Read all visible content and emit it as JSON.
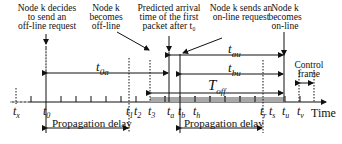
{
  "annotations": [
    {
      "id": "t0-note",
      "lines": [
        "Node k decides",
        "to send an",
        "off-line request"
      ]
    },
    {
      "id": "t2-note",
      "lines": [
        "Node k",
        "becomes",
        "off-line"
      ]
    },
    {
      "id": "ta-note",
      "lines": [
        "Predicted  arrival",
        "time of the first",
        "packet after t₀"
      ]
    },
    {
      "id": "tb-note",
      "lines": [
        "Node k sends an",
        "on-line request"
      ]
    },
    {
      "id": "tu-note",
      "lines": [
        "Node k",
        "becomes",
        "on-line"
      ]
    },
    {
      "id": "control-note",
      "lines": [
        "Control",
        "frame"
      ]
    }
  ],
  "intervals": {
    "t0a": {
      "base": "t",
      "sub": "0a"
    },
    "tau": {
      "base": "t",
      "sub": "au"
    },
    "tbu": {
      "base": "t",
      "sub": "bu"
    },
    "Toff": {
      "base": "T",
      "sub": "off"
    }
  },
  "axis": {
    "label": "Time",
    "ticks": [
      {
        "base": "t",
        "sub": "x"
      },
      {
        "base": "t",
        "sub": "0"
      },
      {
        "base": "t",
        "sub": "1"
      },
      {
        "base": "t",
        "sub": "2"
      },
      {
        "base": "t",
        "sub": "3"
      },
      {
        "base": "t",
        "sub": "a"
      },
      {
        "base": "t",
        "sub": "b"
      },
      {
        "base": "t",
        "sub": "h"
      },
      {
        "base": "t",
        "sub": "r"
      },
      {
        "base": "t",
        "sub": "s"
      },
      {
        "base": "t",
        "sub": "u"
      },
      {
        "base": "t",
        "sub": "v"
      }
    ]
  },
  "delays": [
    {
      "label": "Propagation delay"
    },
    {
      "label": "Propagation delay"
    }
  ],
  "colors": {
    "ink": "#111111",
    "shaded_band": "#9a9a9a"
  }
}
